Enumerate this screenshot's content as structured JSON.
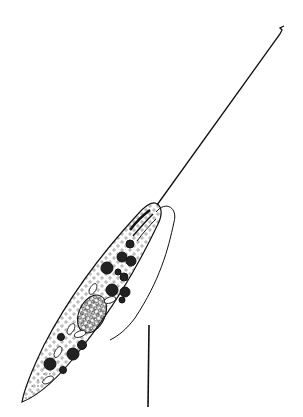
{
  "figure": {
    "background": "#ffffff",
    "ink": "#111111",
    "parts": {
      "flagellum": {
        "from": [
          157,
          205
        ],
        "to": [
          284,
          27
        ]
      },
      "body": "elongate spindle-shaped cell",
      "second_flagellum": "trailing recurrent flagellum along right side",
      "nucleus": "granular oval nucleus mid-posterior",
      "inclusions": "dark spherical granules and pale oval bodies",
      "posterior": "stippled tapering tail"
    },
    "scale_bar": {
      "x1": 149,
      "y1": 325,
      "x2": 148,
      "y2": 407
    }
  }
}
